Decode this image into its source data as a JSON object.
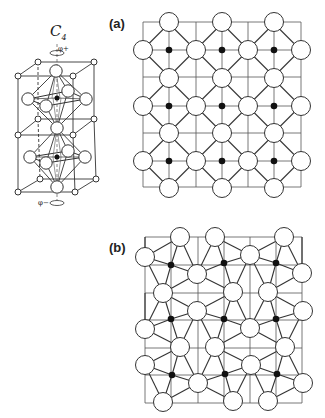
{
  "figure": {
    "colors": {
      "line": "#333333",
      "thin": "#555555",
      "atom_fill": "#ffffff",
      "dot": "#111111"
    },
    "panel_a": {
      "label": "(a)",
      "label_pos": [
        109,
        16
      ],
      "grid": {
        "xs": [
          143,
          169,
          196,
          222,
          248,
          274,
          301
        ],
        "ys": [
          22,
          50,
          77,
          106,
          133,
          161,
          187
        ]
      },
      "atom_radius": 9.5,
      "dot_radius": 3.3,
      "dots": [
        [
          169,
          50
        ],
        [
          222,
          50
        ],
        [
          274,
          50
        ],
        [
          169,
          106
        ],
        [
          222,
          106
        ],
        [
          274,
          106
        ],
        [
          169,
          161
        ],
        [
          222,
          161
        ],
        [
          274,
          161
        ]
      ],
      "atoms": [
        [
          169,
          22
        ],
        [
          222,
          22
        ],
        [
          274,
          22
        ],
        [
          143,
          50
        ],
        [
          196,
          50
        ],
        [
          248,
          50
        ],
        [
          301,
          50
        ],
        [
          169,
          78
        ],
        [
          222,
          78
        ],
        [
          274,
          78
        ],
        [
          143,
          106
        ],
        [
          196,
          106
        ],
        [
          248,
          106
        ],
        [
          301,
          106
        ],
        [
          169,
          133
        ],
        [
          222,
          133
        ],
        [
          274,
          133
        ],
        [
          143,
          161
        ],
        [
          196,
          161
        ],
        [
          248,
          161
        ],
        [
          301,
          161
        ],
        [
          169,
          188
        ],
        [
          222,
          188
        ],
        [
          274,
          188
        ]
      ]
    },
    "panel_b": {
      "label": "(b)",
      "label_pos": [
        109,
        240
      ],
      "grid": {
        "xs": [
          145,
          171,
          198,
          224,
          250,
          276,
          302
        ],
        "ys": [
          237,
          265,
          293,
          320,
          348,
          375,
          403
        ]
      },
      "atom_radius": 9.5,
      "dot_radius": 3.3,
      "dots": [
        [
          171,
          265
        ],
        [
          224,
          263
        ],
        [
          276,
          263
        ],
        [
          171,
          319
        ],
        [
          224,
          319
        ],
        [
          276,
          319
        ],
        [
          172,
          375
        ],
        [
          225,
          374
        ],
        [
          277,
          374
        ]
      ],
      "atoms": [
        [
          180,
          237
        ],
        [
          215,
          237
        ],
        [
          284,
          237
        ],
        [
          145,
          257
        ],
        [
          250,
          255
        ],
        [
          302,
          273
        ],
        [
          197,
          274
        ],
        [
          163,
          293
        ],
        [
          233,
          292
        ],
        [
          268,
          292
        ],
        [
          303,
          311
        ],
        [
          197,
          311
        ],
        [
          145,
          329
        ],
        [
          250,
          328
        ],
        [
          180,
          347
        ],
        [
          215,
          347
        ],
        [
          285,
          347
        ],
        [
          145,
          365
        ],
        [
          251,
          365
        ],
        [
          198,
          383
        ],
        [
          303,
          383
        ],
        [
          163,
          402
        ],
        [
          233,
          401
        ],
        [
          268,
          401
        ]
      ],
      "bonds": [
        [
          [
            171,
            265
          ],
          [
            180,
            237
          ]
        ],
        [
          [
            171,
            265
          ],
          [
            145,
            257
          ]
        ],
        [
          [
            171,
            265
          ],
          [
            197,
            274
          ]
        ],
        [
          [
            171,
            265
          ],
          [
            163,
            293
          ]
        ],
        [
          [
            224,
            263
          ],
          [
            215,
            237
          ]
        ],
        [
          [
            224,
            263
          ],
          [
            250,
            255
          ]
        ],
        [
          [
            224,
            263
          ],
          [
            197,
            274
          ]
        ],
        [
          [
            224,
            263
          ],
          [
            233,
            292
          ]
        ],
        [
          [
            276,
            263
          ],
          [
            284,
            237
          ]
        ],
        [
          [
            276,
            263
          ],
          [
            302,
            273
          ]
        ],
        [
          [
            276,
            263
          ],
          [
            250,
            255
          ]
        ],
        [
          [
            276,
            263
          ],
          [
            268,
            292
          ]
        ],
        [
          [
            171,
            319
          ],
          [
            163,
            293
          ]
        ],
        [
          [
            171,
            319
          ],
          [
            197,
            311
          ]
        ],
        [
          [
            171,
            319
          ],
          [
            145,
            329
          ]
        ],
        [
          [
            171,
            319
          ],
          [
            180,
            347
          ]
        ],
        [
          [
            224,
            319
          ],
          [
            233,
            292
          ]
        ],
        [
          [
            224,
            319
          ],
          [
            197,
            311
          ]
        ],
        [
          [
            224,
            319
          ],
          [
            250,
            328
          ]
        ],
        [
          [
            224,
            319
          ],
          [
            215,
            347
          ]
        ],
        [
          [
            276,
            319
          ],
          [
            268,
            292
          ]
        ],
        [
          [
            276,
            319
          ],
          [
            303,
            311
          ]
        ],
        [
          [
            276,
            319
          ],
          [
            250,
            328
          ]
        ],
        [
          [
            276,
            319
          ],
          [
            285,
            347
          ]
        ],
        [
          [
            172,
            375
          ],
          [
            180,
            347
          ]
        ],
        [
          [
            172,
            375
          ],
          [
            145,
            365
          ]
        ],
        [
          [
            172,
            375
          ],
          [
            198,
            383
          ]
        ],
        [
          [
            172,
            375
          ],
          [
            163,
            402
          ]
        ],
        [
          [
            225,
            374
          ],
          [
            215,
            347
          ]
        ],
        [
          [
            225,
            374
          ],
          [
            251,
            365
          ]
        ],
        [
          [
            225,
            374
          ],
          [
            198,
            383
          ]
        ],
        [
          [
            225,
            374
          ],
          [
            233,
            401
          ]
        ],
        [
          [
            277,
            374
          ],
          [
            285,
            347
          ]
        ],
        [
          [
            277,
            374
          ],
          [
            251,
            365
          ]
        ],
        [
          [
            277,
            374
          ],
          [
            303,
            383
          ]
        ],
        [
          [
            277,
            374
          ],
          [
            268,
            401
          ]
        ],
        [
          [
            145,
            257
          ],
          [
            180,
            237
          ]
        ],
        [
          [
            180,
            237
          ],
          [
            197,
            274
          ]
        ],
        [
          [
            197,
            274
          ],
          [
            215,
            237
          ]
        ],
        [
          [
            215,
            237
          ],
          [
            250,
            255
          ]
        ],
        [
          [
            250,
            255
          ],
          [
            284,
            237
          ]
        ],
        [
          [
            284,
            237
          ],
          [
            302,
            273
          ]
        ],
        [
          [
            145,
            257
          ],
          [
            163,
            293
          ]
        ],
        [
          [
            163,
            293
          ],
          [
            197,
            274
          ]
        ],
        [
          [
            197,
            274
          ],
          [
            233,
            292
          ]
        ],
        [
          [
            233,
            292
          ],
          [
            250,
            255
          ]
        ],
        [
          [
            250,
            255
          ],
          [
            268,
            292
          ]
        ],
        [
          [
            268,
            292
          ],
          [
            302,
            273
          ]
        ],
        [
          [
            163,
            293
          ],
          [
            197,
            311
          ]
        ],
        [
          [
            197,
            311
          ],
          [
            233,
            292
          ]
        ],
        [
          [
            268,
            292
          ],
          [
            303,
            311
          ]
        ],
        [
          [
            233,
            292
          ],
          [
            250,
            328
          ]
        ],
        [
          [
            250,
            328
          ],
          [
            268,
            292
          ]
        ],
        [
          [
            163,
            293
          ],
          [
            145,
            329
          ]
        ],
        [
          [
            145,
            329
          ],
          [
            180,
            347
          ]
        ],
        [
          [
            180,
            347
          ],
          [
            197,
            311
          ]
        ],
        [
          [
            197,
            311
          ],
          [
            215,
            347
          ]
        ],
        [
          [
            215,
            347
          ],
          [
            250,
            328
          ]
        ],
        [
          [
            250,
            328
          ],
          [
            285,
            347
          ]
        ],
        [
          [
            285,
            347
          ],
          [
            303,
            311
          ]
        ],
        [
          [
            145,
            365
          ],
          [
            180,
            347
          ]
        ],
        [
          [
            180,
            347
          ],
          [
            198,
            383
          ]
        ],
        [
          [
            198,
            383
          ],
          [
            215,
            347
          ]
        ],
        [
          [
            215,
            347
          ],
          [
            251,
            365
          ]
        ],
        [
          [
            251,
            365
          ],
          [
            285,
            347
          ]
        ],
        [
          [
            285,
            347
          ],
          [
            303,
            383
          ]
        ],
        [
          [
            145,
            365
          ],
          [
            163,
            402
          ]
        ],
        [
          [
            163,
            402
          ],
          [
            198,
            383
          ]
        ],
        [
          [
            198,
            383
          ],
          [
            233,
            401
          ]
        ],
        [
          [
            233,
            401
          ],
          [
            251,
            365
          ]
        ],
        [
          [
            251,
            365
          ],
          [
            268,
            401
          ]
        ],
        [
          [
            268,
            401
          ],
          [
            303,
            383
          ]
        ],
        [
          [
            145,
            257
          ],
          [
            145,
            237
          ]
        ],
        [
          [
            145,
            329
          ],
          [
            145,
            293
          ]
        ],
        [
          [
            302,
            273
          ],
          [
            302,
            237
          ]
        ]
      ]
    },
    "unit_cell": {
      "axis_label": "C",
      "axis_sub": "4",
      "axis_label_pos": [
        50,
        22
      ],
      "phi_top": "φ+",
      "phi_bottom": "φ−",
      "top_face": [
        [
          38,
          62
        ],
        [
          94,
          62
        ],
        [
          73,
          76
        ],
        [
          18,
          76
        ]
      ],
      "mid_face": [
        [
          38,
          119
        ],
        [
          94,
          119
        ],
        [
          73,
          135
        ],
        [
          18,
          135
        ]
      ],
      "bottom_face": [
        [
          40,
          179
        ],
        [
          96,
          179
        ],
        [
          75,
          192
        ],
        [
          18,
          192
        ]
      ],
      "corner_radius": 3,
      "octahedra": [
        {
          "center": [
            57,
            98
          ],
          "top": [
            56,
            71
          ],
          "bottom": [
            57,
            128
          ],
          "eq": [
            [
              28,
              99
            ],
            [
              68,
              91
            ],
            [
              86,
              99
            ],
            [
              46,
              106
            ]
          ]
        },
        {
          "center": [
            57,
            157
          ],
          "top": [
            57,
            128
          ],
          "bottom": [
            57,
            187
          ],
          "eq": [
            [
              30,
              157
            ],
            [
              68,
              151
            ],
            [
              85,
              157
            ],
            [
              46,
              163
            ]
          ]
        }
      ],
      "atom_radius": 6.2
    }
  }
}
